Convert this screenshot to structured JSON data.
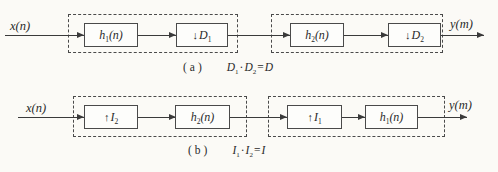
{
  "figure": {
    "colors": {
      "background": "#fbfaf6",
      "line": "#3a3a3a",
      "box_border": "#4a4a4a"
    }
  },
  "diagram_a": {
    "input_label": "x(n)",
    "output_label": "y(m)",
    "blocks": {
      "h1": {
        "var": "h",
        "sub": "1",
        "arg": "(n)"
      },
      "d1": {
        "op": "↓",
        "var": "D",
        "sub": "1"
      },
      "h2": {
        "var": "h",
        "sub": "2",
        "arg": "(n)"
      },
      "d2": {
        "op": "↓",
        "var": "D",
        "sub": "2"
      }
    },
    "caption": {
      "tag": "(a)",
      "formula": [
        {
          "text": "D"
        },
        {
          "text": "1"
        },
        {
          "text": "·"
        },
        {
          "text": "D"
        },
        {
          "text": "2"
        },
        {
          "text": "="
        },
        {
          "text": "D"
        }
      ]
    }
  },
  "diagram_b": {
    "input_label": "x(n)",
    "output_label": "y(m)",
    "blocks": {
      "i2": {
        "op": "↑",
        "var": "I",
        "sub": "2"
      },
      "h2": {
        "var": "h",
        "sub": "2",
        "arg": "(n)"
      },
      "i1": {
        "op": "↑",
        "var": "I",
        "sub": "1"
      },
      "h1": {
        "var": "h",
        "sub": "1",
        "arg": "(n)"
      }
    },
    "caption": {
      "tag": "(b)",
      "formula": [
        {
          "text": "I"
        },
        {
          "text": "1"
        },
        {
          "text": "·"
        },
        {
          "text": "I"
        },
        {
          "text": "2"
        },
        {
          "text": "="
        },
        {
          "text": "I"
        }
      ]
    }
  }
}
